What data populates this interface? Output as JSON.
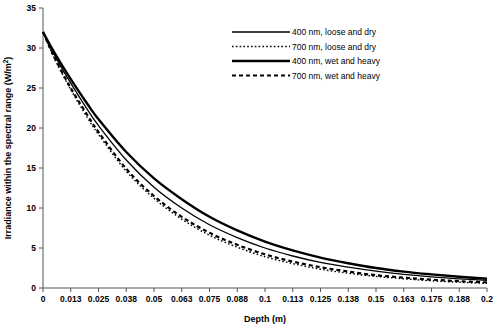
{
  "chart_data": {
    "type": "line",
    "title": "",
    "xlabel": "Depth (m)",
    "ylabel": "Irradiance within the spectral range (W/m²)",
    "xlim": [
      0,
      0.2
    ],
    "ylim": [
      0,
      35
    ],
    "grid": false,
    "legend_position": "top-right",
    "xticks": [
      "0",
      "0.013",
      "0.025",
      "0.038",
      "0.05",
      "0.063",
      "0.075",
      "0.088",
      "0.1",
      "0.113",
      "0.125",
      "0.138",
      "0.15",
      "0.163",
      "0.175",
      "0.188",
      "0.2"
    ],
    "xtick_values": [
      0,
      0.0125,
      0.025,
      0.0375,
      0.05,
      0.0625,
      0.075,
      0.0875,
      0.1,
      0.1125,
      0.125,
      0.1375,
      0.15,
      0.1625,
      0.175,
      0.1875,
      0.2
    ],
    "yticks": [
      "0",
      "5",
      "10",
      "15",
      "20",
      "25",
      "30",
      "35"
    ],
    "ytick_values": [
      0,
      5,
      10,
      15,
      20,
      25,
      30,
      35
    ],
    "x": [
      0,
      0.005,
      0.0125,
      0.02,
      0.025,
      0.0375,
      0.05,
      0.0625,
      0.075,
      0.0875,
      0.1,
      0.1125,
      0.125,
      0.1375,
      0.15,
      0.1625,
      0.175,
      0.1875,
      0.2
    ],
    "series": [
      {
        "name": "400 nm, loose and dry",
        "style": "solid-thin",
        "stroke_width": 1.3,
        "dash": "none",
        "values": [
          32.0,
          29.2,
          25.6,
          22.3,
          20.3,
          16.0,
          12.6,
          10.0,
          7.9,
          6.3,
          5.0,
          4.0,
          3.2,
          2.6,
          2.1,
          1.7,
          1.4,
          1.15,
          0.95
        ]
      },
      {
        "name": "700 nm, loose and dry",
        "style": "dotted-thin",
        "stroke_width": 1.4,
        "dash": "1.6 2.2",
        "values": [
          32.0,
          28.8,
          24.8,
          21.3,
          19.2,
          14.6,
          11.2,
          8.6,
          6.6,
          5.1,
          3.9,
          3.05,
          2.35,
          1.85,
          1.45,
          1.15,
          0.9,
          0.72,
          0.58
        ]
      },
      {
        "name": "400 nm, wet and heavy",
        "style": "solid-thick",
        "stroke_width": 2.4,
        "dash": "none",
        "values": [
          32.0,
          29.5,
          26.1,
          23.0,
          21.1,
          17.0,
          13.7,
          11.1,
          8.9,
          7.2,
          5.8,
          4.7,
          3.8,
          3.1,
          2.5,
          2.05,
          1.7,
          1.4,
          1.15
        ]
      },
      {
        "name": "700 nm, wet and heavy",
        "style": "dashed-thick",
        "stroke_width": 2.2,
        "dash": "4 3",
        "values": [
          32.0,
          28.9,
          25.0,
          21.6,
          19.5,
          14.9,
          11.5,
          8.9,
          6.9,
          5.4,
          4.2,
          3.3,
          2.6,
          2.05,
          1.6,
          1.3,
          1.05,
          0.85,
          0.7
        ]
      }
    ]
  },
  "legend": {
    "entries": [
      {
        "label": "400 nm, loose and dry"
      },
      {
        "label": "700 nm, loose and dry"
      },
      {
        "label": "400 nm, wet and heavy"
      },
      {
        "label": "700 nm, wet and heavy"
      }
    ]
  },
  "axes": {
    "x_title": "Depth (m)",
    "y_title_main": "Irradiance within the spectral range (W/m",
    "y_title_sup": "2",
    "y_title_close": ")"
  }
}
